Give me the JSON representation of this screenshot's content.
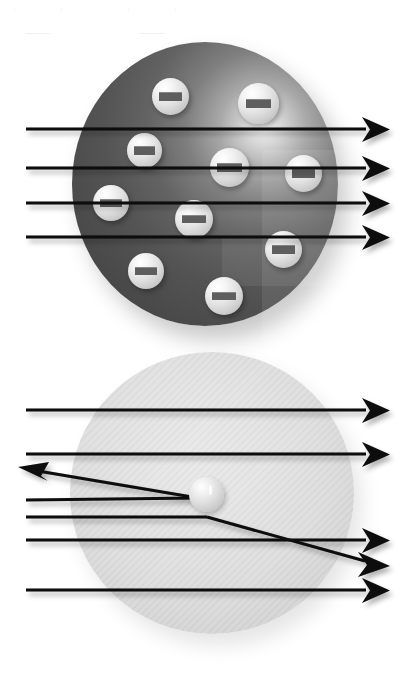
{
  "figure": {
    "background_color": "#ffffff",
    "width": 419,
    "height": 673
  },
  "watermark": {
    "name": "hexagon-outline-watermark",
    "color": "#f0f0f0",
    "shapes": [
      {
        "x": 14,
        "y": -14,
        "w": 46,
        "h": 46
      },
      {
        "x": 128,
        "y": -14,
        "w": 46,
        "h": 46
      }
    ]
  },
  "panels": [
    {
      "id": "thomson-panel",
      "model_name": "plum-pudding-model",
      "sphere": {
        "name": "positive-charge-sphere",
        "cx": 205,
        "cy": 184,
        "rx": 133,
        "ry": 142,
        "fill_light": "#f2f2f2",
        "fill_dark": "#3d3d3d",
        "highlight_x_pct": 72,
        "highlight_y_pct": 30
      },
      "particles": {
        "name": "electron",
        "charge_label": "minus",
        "count": 10,
        "body_color": "#e2e2e2",
        "bar_color": "#5e5e5e",
        "positions": [
          {
            "x": 152,
            "y": 78,
            "d": 37
          },
          {
            "x": 238,
            "y": 83,
            "d": 41
          },
          {
            "x": 127,
            "y": 133,
            "d": 35
          },
          {
            "x": 210,
            "y": 148,
            "d": 39
          },
          {
            "x": 285,
            "y": 155,
            "d": 37
          },
          {
            "x": 93,
            "y": 185,
            "d": 36
          },
          {
            "x": 175,
            "y": 200,
            "d": 38
          },
          {
            "x": 265,
            "y": 231,
            "d": 37
          },
          {
            "x": 128,
            "y": 253,
            "d": 36
          },
          {
            "x": 205,
            "y": 277,
            "d": 38
          }
        ]
      },
      "rays": {
        "name": "alpha-particle-ray",
        "count": 4,
        "color": "#0a0a0a",
        "behavior": "all-pass-straight-through",
        "lines": [
          {
            "x1": 26,
            "y1": 129,
            "x2": 381,
            "y2": 129,
            "arrow": "right"
          },
          {
            "x1": 26,
            "y1": 168,
            "x2": 381,
            "y2": 168,
            "arrow": "right"
          },
          {
            "x1": 26,
            "y1": 203,
            "x2": 381,
            "y2": 203,
            "arrow": "right"
          },
          {
            "x1": 26,
            "y1": 237,
            "x2": 381,
            "y2": 237,
            "arrow": "right"
          }
        ]
      }
    },
    {
      "id": "rutherford-panel",
      "model_name": "nuclear-model",
      "sphere": {
        "name": "diffuse-atom-cloud",
        "cx": 212,
        "cy": 493,
        "rx": 142,
        "ry": 141,
        "fill_light": "#e9e9e9",
        "fill_dark": "#cacaca",
        "texture": "diagonal-hatch"
      },
      "nucleus": {
        "name": "nucleus",
        "x": 206,
        "y": 494,
        "d": 35,
        "color": "#dcdcdc"
      },
      "rays": {
        "name": "alpha-particle-ray",
        "count": 6,
        "color": "#0a0a0a",
        "behavior": "most-pass-through-two-deflected",
        "lines": [
          {
            "x1": 26,
            "y1": 410,
            "x2": 381,
            "y2": 410,
            "arrow": "right",
            "type": "straight"
          },
          {
            "x1": 26,
            "y1": 454,
            "x2": 381,
            "y2": 454,
            "arrow": "right",
            "type": "straight"
          },
          {
            "x1": 26,
            "y1": 500,
            "x2": 196,
            "y2": 497,
            "arrow": "none",
            "type": "backscatter-in"
          },
          {
            "x1": 196,
            "y1": 497,
            "x2": 25,
            "y2": 468,
            "arrow": "upleft",
            "type": "backscatter-out"
          },
          {
            "x1": 26,
            "y1": 517,
            "x2": 205,
            "y2": 517,
            "arrow": "none",
            "type": "deflected-in"
          },
          {
            "x1": 205,
            "y1": 517,
            "x2": 381,
            "y2": 566,
            "arrow": "right",
            "type": "deflected-out"
          },
          {
            "x1": 26,
            "y1": 540,
            "x2": 381,
            "y2": 540,
            "arrow": "right",
            "type": "straight"
          },
          {
            "x1": 26,
            "y1": 590,
            "x2": 381,
            "y2": 590,
            "arrow": "right",
            "type": "straight"
          }
        ]
      }
    }
  ]
}
